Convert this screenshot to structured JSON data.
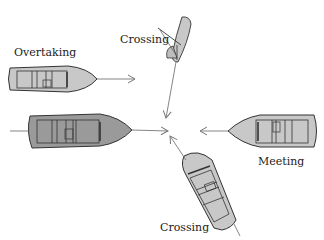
{
  "diagram": {
    "colors": {
      "hull_light": "#c8c8c8",
      "hull_dark": "#9a9a9a",
      "outline": "#333333",
      "arrow": "#777777",
      "background": "#ffffff"
    },
    "labels": {
      "overtaking": "Overtaking",
      "crossing_top": "Crossing",
      "meeting": "Meeting",
      "crossing_bottom": "Crossing"
    },
    "vessels": [
      {
        "id": "overtaking-boat",
        "type": "rowboat",
        "heading": "east",
        "label": "Overtaking"
      },
      {
        "id": "own-boat",
        "type": "rowboat",
        "heading": "east",
        "label": ""
      },
      {
        "id": "crossing-sailboat",
        "type": "sailboat",
        "heading": "south-southwest",
        "label": "Crossing"
      },
      {
        "id": "meeting-boat",
        "type": "rowboat",
        "heading": "west",
        "label": "Meeting"
      },
      {
        "id": "crossing-boat",
        "type": "rowboat",
        "heading": "north-northwest",
        "label": "Crossing"
      }
    ]
  }
}
